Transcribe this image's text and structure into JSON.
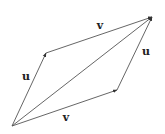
{
  "diagram": {
    "points": {
      "origin": [
        12,
        126
      ],
      "u_tip": [
        46,
        53
      ],
      "v_tip": [
        117,
        90
      ],
      "sum_tip": [
        152,
        17
      ]
    },
    "labels": {
      "u_left": {
        "text": "u",
        "x": 26,
        "y": 76
      },
      "v_top": {
        "text": "v",
        "x": 100,
        "y": 25
      },
      "u_right": {
        "text": "u",
        "x": 146,
        "y": 51
      },
      "v_bottom": {
        "text": "v",
        "x": 66,
        "y": 117
      }
    },
    "colors": {
      "line": "#555555",
      "arrowhead": "#333333",
      "label": "#222222",
      "background": "#ffffff"
    }
  }
}
